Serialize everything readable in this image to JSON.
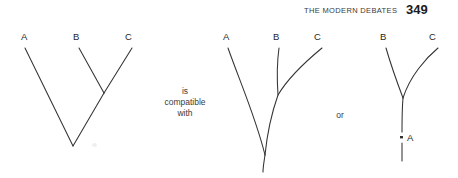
{
  "page": {
    "width": 458,
    "height": 178,
    "background": "#ffffff",
    "ink_color": "#333333",
    "text_color": "#1f1f1f"
  },
  "running_head": {
    "title": "THE MODERN DEBATES",
    "page_number": "349"
  },
  "connectors": [
    {
      "id": "compatible",
      "text": "is\ncompatible\nwith",
      "line1": "is",
      "line2": "compatible",
      "line3": "with"
    },
    {
      "id": "or",
      "text": "or"
    }
  ],
  "figure": {
    "caption": "",
    "diagram_count": 3,
    "diagrams": [
      {
        "id": "tree-left",
        "style": "straight-line cladogram",
        "description": "Unrooted three-taxon tree: B and C join at an internal node, which joins A at the basal vertex.",
        "labels": [
          {
            "taxon": "A",
            "x": 22,
            "y": 39
          },
          {
            "taxon": "B",
            "x": 74,
            "y": 39
          },
          {
            "taxon": "C",
            "x": 126,
            "y": 39
          }
        ],
        "nodes": [
          {
            "name": "tip-A",
            "x": 25,
            "y": 48
          },
          {
            "name": "tip-B",
            "x": 79,
            "y": 48
          },
          {
            "name": "tip-C",
            "x": 132,
            "y": 48
          },
          {
            "name": "node-BC",
            "x": 104,
            "y": 93
          },
          {
            "name": "node-root",
            "x": 73,
            "y": 146
          }
        ]
      },
      {
        "id": "tree-middle",
        "style": "curved phylogram",
        "description": "Rooted tree with curved branches: A diverges first, B branches off the C lineage partway up; a short basal stem descends below the root.",
        "labels": [
          {
            "taxon": "A",
            "x": 224,
            "y": 39
          },
          {
            "taxon": "B",
            "x": 274,
            "y": 39
          },
          {
            "taxon": "C",
            "x": 315,
            "y": 39
          }
        ],
        "nodes": [
          {
            "name": "tip-A",
            "x": 228,
            "y": 48
          },
          {
            "name": "tip-B",
            "x": 279,
            "y": 48
          },
          {
            "name": "tip-C",
            "x": 322,
            "y": 48
          },
          {
            "name": "node-BC",
            "x": 278,
            "y": 95
          },
          {
            "name": "node-root",
            "x": 265,
            "y": 155
          },
          {
            "name": "stem-base",
            "x": 263,
            "y": 172
          }
        ]
      },
      {
        "id": "tree-right",
        "style": "curved phylogram with marked ancestor",
        "description": "Rooted tree: B and C diverge from a node; the stem below carries a tick mark labelled A, indicating A is an ancestor on the lineage.",
        "labels": [
          {
            "taxon": "B",
            "x": 381,
            "y": 39
          },
          {
            "taxon": "C",
            "x": 430,
            "y": 39
          },
          {
            "taxon": "A",
            "x": 408,
            "y": 141
          }
        ],
        "nodes": [
          {
            "name": "tip-B",
            "x": 386,
            "y": 48
          },
          {
            "name": "tip-C",
            "x": 438,
            "y": 48
          },
          {
            "name": "node-BC",
            "x": 403,
            "y": 98
          },
          {
            "name": "ancestor-A-mark",
            "x": 402,
            "y": 137
          },
          {
            "name": "stem-base",
            "x": 402,
            "y": 161
          }
        ]
      }
    ]
  }
}
